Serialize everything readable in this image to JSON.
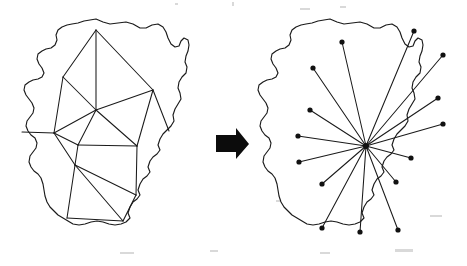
{
  "figure": {
    "background_color": "#ffffff",
    "ink_color": "#1a1a1a",
    "node_color": "#111111",
    "width": 467,
    "height": 266
  },
  "arrow": {
    "label": "transforms-to",
    "color": "#0c0c0c",
    "direction": "right",
    "points": "216,135 236,135 236,128 249,144 236,159 236,152 216,152"
  },
  "left_panel": {
    "name": "triangulated-region",
    "caption": "",
    "outline_points": "96,19 103,22 110,24 118,23 126,22 133,24 140,28 146,28 152,25 158,24 163,27 166,32 168,38 171,44 175,47 179,46 181,41 184,38 188,40 189,45 188,51 186,56 185,62 187,67 186,73 182,77 179,82 178,88 180,93 181,99 178,104 175,109 173,115 174,121 171,126 167,130 163,134 160,139 158,145 160,150 157,154 153,157 150,161 148,167 150,172 147,176 143,179 140,184 138,190 140,195 137,199 133,202 130,207 128,213 130,218 126,222 121,224 115,225 109,224 103,222 97,221 91,222 85,224 79,225 73,224 68,221 63,218 58,215 54,211 50,207 47,202 45,196 44,190 43,184 41,178 38,174 34,171 31,167 29,162 30,156 33,152 36,148 37,143 35,138 31,135 28,131 26,126 27,121 30,117 33,113 34,108 32,103 29,99 26,95 24,90 25,85 29,82 33,80 38,79 42,77 44,73 42,68 39,64 37,59 38,54 42,51 46,49 51,48 55,45 57,40 56,35 58,30 62,27 67,25 72,24 78,23 84,21 90,20",
    "mesh_vertices": [
      {
        "id": "v1",
        "x": 96,
        "y": 30
      },
      {
        "id": "v2",
        "x": 63,
        "y": 77
      },
      {
        "id": "v3",
        "x": 153,
        "y": 90
      },
      {
        "id": "v4",
        "x": 96,
        "y": 110
      },
      {
        "id": "v5",
        "x": 22,
        "y": 132
      },
      {
        "id": "v6",
        "x": 54,
        "y": 133
      },
      {
        "id": "v7",
        "x": 78,
        "y": 145
      },
      {
        "id": "v8",
        "x": 137,
        "y": 146
      },
      {
        "id": "v9",
        "x": 75,
        "y": 165
      },
      {
        "id": "v10",
        "x": 136,
        "y": 195
      },
      {
        "id": "v11",
        "x": 123,
        "y": 221
      },
      {
        "id": "v12",
        "x": 67,
        "y": 218
      },
      {
        "id": "v13",
        "x": 169,
        "y": 131
      }
    ],
    "mesh_edges": [
      [
        "v1",
        "v2"
      ],
      [
        "v1",
        "v3"
      ],
      [
        "v1",
        "v4"
      ],
      [
        "v2",
        "v4"
      ],
      [
        "v2",
        "v6"
      ],
      [
        "v3",
        "v4"
      ],
      [
        "v3",
        "v8"
      ],
      [
        "v3",
        "v13"
      ],
      [
        "v4",
        "v6"
      ],
      [
        "v4",
        "v7"
      ],
      [
        "v4",
        "v8"
      ],
      [
        "v5",
        "v6"
      ],
      [
        "v6",
        "v7"
      ],
      [
        "v6",
        "v9"
      ],
      [
        "v7",
        "v8"
      ],
      [
        "v7",
        "v9"
      ],
      [
        "v8",
        "v10"
      ],
      [
        "v9",
        "v10"
      ],
      [
        "v9",
        "v11"
      ],
      [
        "v10",
        "v11"
      ],
      [
        "v11",
        "v12"
      ],
      [
        "v9",
        "v12"
      ]
    ],
    "edge_count": 22,
    "vertex_count": 13,
    "show_vertex_dots": false
  },
  "right_panel": {
    "name": "star-topology-region",
    "caption": "",
    "outline_points": "330,19 337,22 344,24 352,23 360,22 367,24 374,28 380,28 386,25 392,24 397,27 400,32 402,38 405,44 409,47 413,46 415,41 418,38 422,40 423,45 422,51 420,56 419,62 421,67 420,73 416,77 413,82 412,88 414,93 415,99 412,104 409,109 407,115 408,121 405,126 401,130 397,134 394,139 392,145 394,150 391,154 387,157 384,161 382,167 384,172 381,176 377,179 374,184 372,190 374,195 371,199 367,202 364,207 362,213 364,218 360,222 355,224 349,225 343,224 337,222 331,221 325,222 319,224 313,225 307,224 302,221 297,218 292,215 288,211 284,207 281,202 279,196 278,190 277,184 275,178 272,174 268,171 265,167 263,162 264,156 267,152 270,148 271,143 269,138 265,135 262,131 260,126 261,121 264,117 267,113 268,108 266,103 263,99 260,95 258,90 259,85 263,82 267,80 272,79 276,77 278,73 276,68 273,64 271,59 272,54 276,51 280,49 285,48 289,45 291,40 290,35 292,30 296,27 301,25 306,24 312,23 318,21 324,20",
    "hub": {
      "id": "hub",
      "x": 366,
      "y": 146,
      "label": "central-hub"
    },
    "leaf_nodes": [
      {
        "id": "n1",
        "x": 342,
        "y": 42
      },
      {
        "id": "n2",
        "x": 414,
        "y": 31
      },
      {
        "id": "n3",
        "x": 443,
        "y": 55
      },
      {
        "id": "n4",
        "x": 313,
        "y": 68
      },
      {
        "id": "n5",
        "x": 438,
        "y": 98
      },
      {
        "id": "n6",
        "x": 443,
        "y": 124
      },
      {
        "id": "n7",
        "x": 310,
        "y": 110
      },
      {
        "id": "n8",
        "x": 298,
        "y": 136
      },
      {
        "id": "n9",
        "x": 411,
        "y": 158
      },
      {
        "id": "n10",
        "x": 299,
        "y": 162
      },
      {
        "id": "n11",
        "x": 396,
        "y": 182
      },
      {
        "id": "n12",
        "x": 322,
        "y": 184
      },
      {
        "id": "n13",
        "x": 322,
        "y": 228
      },
      {
        "id": "n14",
        "x": 360,
        "y": 232
      },
      {
        "id": "n15",
        "x": 398,
        "y": 230
      }
    ],
    "spoke_count": 15,
    "show_vertex_dots": true,
    "dot_radius": 2.6
  },
  "artifacts": {
    "specks": [
      {
        "x": 175,
        "y": 3,
        "w": 3,
        "h": 2
      },
      {
        "x": 232,
        "y": 2,
        "w": 2,
        "h": 4
      },
      {
        "x": 300,
        "y": 8,
        "w": 10,
        "h": 2
      },
      {
        "x": 340,
        "y": 6,
        "w": 6,
        "h": 2
      },
      {
        "x": 120,
        "y": 252,
        "w": 14,
        "h": 2
      },
      {
        "x": 210,
        "y": 250,
        "w": 8,
        "h": 2
      },
      {
        "x": 320,
        "y": 252,
        "w": 10,
        "h": 2
      },
      {
        "x": 395,
        "y": 249,
        "w": 18,
        "h": 3
      },
      {
        "x": 430,
        "y": 215,
        "w": 12,
        "h": 2
      },
      {
        "x": 276,
        "y": 200,
        "w": 10,
        "h": 2
      }
    ]
  }
}
